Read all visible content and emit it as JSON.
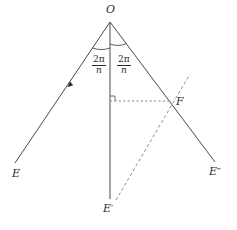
{
  "figure": {
    "background_color": "#ffffff",
    "stroke_color": "#4a4a4a",
    "text_color": "#2b2b2b",
    "dash_color": "#8a8a8a"
  },
  "labels": {
    "vertex_o": "O",
    "ray_e": "E",
    "ray_e_prime_base": "E",
    "ray_e_prime_mark": "′",
    "ray_e_double_prime_base": "E",
    "ray_e_double_prime_mark": "″",
    "point_f": "F"
  },
  "angles": {
    "left": {
      "numerator": "2π",
      "denominator": "n"
    },
    "right": {
      "numerator": "2π",
      "denominator": "n"
    }
  },
  "geometry": {
    "vertex": {
      "x": 110,
      "y": 22
    },
    "ray_e_end": {
      "x": 15,
      "y": 163
    },
    "ray_e_prime_end": {
      "x": 110,
      "y": 199
    },
    "ray_e_double_prime_end": {
      "x": 215,
      "y": 162
    },
    "point_f": {
      "x": 172,
      "y": 101
    },
    "perp_foot": {
      "x": 110,
      "y": 101
    },
    "dashed_diagonal_start": {
      "x": 116,
      "y": 200
    },
    "dashed_diagonal_end": {
      "x": 190,
      "y": 74
    },
    "arrow_tick": {
      "x": 70,
      "y": 84
    },
    "right_angle_size": 5,
    "arc_radius_left": 26,
    "arc_radius_right": 22
  }
}
